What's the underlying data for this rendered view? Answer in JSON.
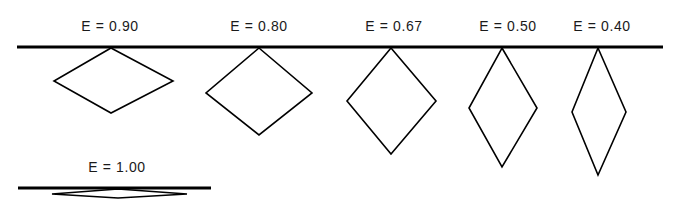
{
  "diagram": {
    "colors": {
      "line": "#000000",
      "shape_stroke": "#000000",
      "text": "#1a1a1a",
      "background": "#ffffff"
    },
    "top_line": {
      "x1": 17,
      "y1": 47,
      "x2": 663,
      "y2": 47,
      "stroke_width": 3.2
    },
    "bottom_line": {
      "x1": 18,
      "y1": 188,
      "x2": 211,
      "y2": 188,
      "stroke_width": 3.2
    },
    "shapes": [
      {
        "label": "E = 0.90",
        "label_pos": {
          "x": 110,
          "y": 20
        },
        "top": [
          111,
          48
        ],
        "left": [
          54,
          81
        ],
        "right": [
          173,
          81
        ],
        "bottom": [
          111,
          113
        ]
      },
      {
        "label": "E = 0.80",
        "label_pos": {
          "x": 259,
          "y": 20
        },
        "top": [
          259,
          48
        ],
        "left": [
          206,
          93
        ],
        "right": [
          312,
          93
        ],
        "bottom": [
          259,
          135
        ]
      },
      {
        "label": "E = 0.67",
        "label_pos": {
          "x": 394,
          "y": 20
        },
        "top": [
          391,
          48
        ],
        "left": [
          347,
          101
        ],
        "right": [
          436,
          101
        ],
        "bottom": [
          391,
          154
        ]
      },
      {
        "label": "E = 0.50",
        "label_pos": {
          "x": 508,
          "y": 20
        },
        "top": [
          502,
          48
        ],
        "left": [
          469,
          108
        ],
        "right": [
          537,
          108
        ],
        "bottom": [
          502,
          167
        ]
      },
      {
        "label": "E = 0.40",
        "label_pos": {
          "x": 602,
          "y": 20
        },
        "top": [
          598,
          48
        ],
        "left": [
          572,
          112
        ],
        "right": [
          626,
          112
        ],
        "bottom": [
          598,
          175
        ]
      },
      {
        "label": "E = 1.00",
        "label_pos": {
          "x": 117,
          "y": 161
        },
        "top": [
          118,
          189
        ],
        "left": [
          52,
          194
        ],
        "right": [
          187,
          194
        ],
        "bottom": [
          118,
          198
        ]
      }
    ]
  }
}
